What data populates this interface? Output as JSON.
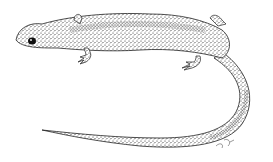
{
  "image": {
    "subject": "salamander",
    "style": "stippled pen-and-ink illustration",
    "background": "#ffffff",
    "ink": "#1a1a1a",
    "signature": "illegible artist signature"
  }
}
